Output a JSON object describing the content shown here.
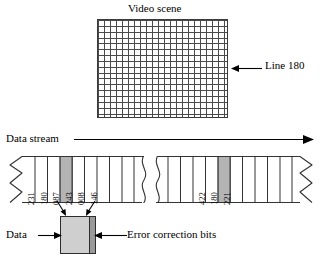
{
  "figure": {
    "video_scene": {
      "title": "Video scene",
      "grid_columns": 22,
      "grid_rows": 17,
      "highlight_line_label": "Line 180",
      "highlight_arrow_icon": "left-arrow-icon"
    },
    "data_stream": {
      "label": "Data stream",
      "direction_arrow_icon": "right-arrow-icon",
      "left_break_icon": "zigzag-break-icon",
      "right_break_icon": "zigzag-break-icon",
      "middle_break_icon": "wavy-break-icon",
      "left_group": {
        "cells": [
          {
            "value": "231",
            "highlighted": false
          },
          {
            "value": "180",
            "highlighted": true
          },
          {
            "value": "087",
            "highlighted": false
          },
          {
            "value": "243",
            "highlighted": false
          },
          {
            "value": "008",
            "highlighted": false
          },
          {
            "value": "146",
            "highlighted": false
          }
        ]
      },
      "right_group": {
        "cells": [
          {
            "value": "422",
            "highlighted": false
          },
          {
            "value": "180",
            "highlighted": true
          },
          {
            "value": "221",
            "highlighted": false
          }
        ]
      }
    },
    "detail_callout": {
      "data_label": "Data",
      "data_arrow_icon": "right-arrow-icon",
      "ecc_label": "Error correction bits",
      "ecc_arrow_icon": "left-arrow-icon",
      "converge_arrows_icon": "double-down-arrow-icon"
    },
    "colors": {
      "ink": "#000000",
      "grid_line": "#4a4a4a",
      "cell_highlight": "#b4b4b4",
      "data_block": "#cfcfcf",
      "ecc_strip": "#9a9a9a",
      "background": "#ffffff"
    }
  }
}
